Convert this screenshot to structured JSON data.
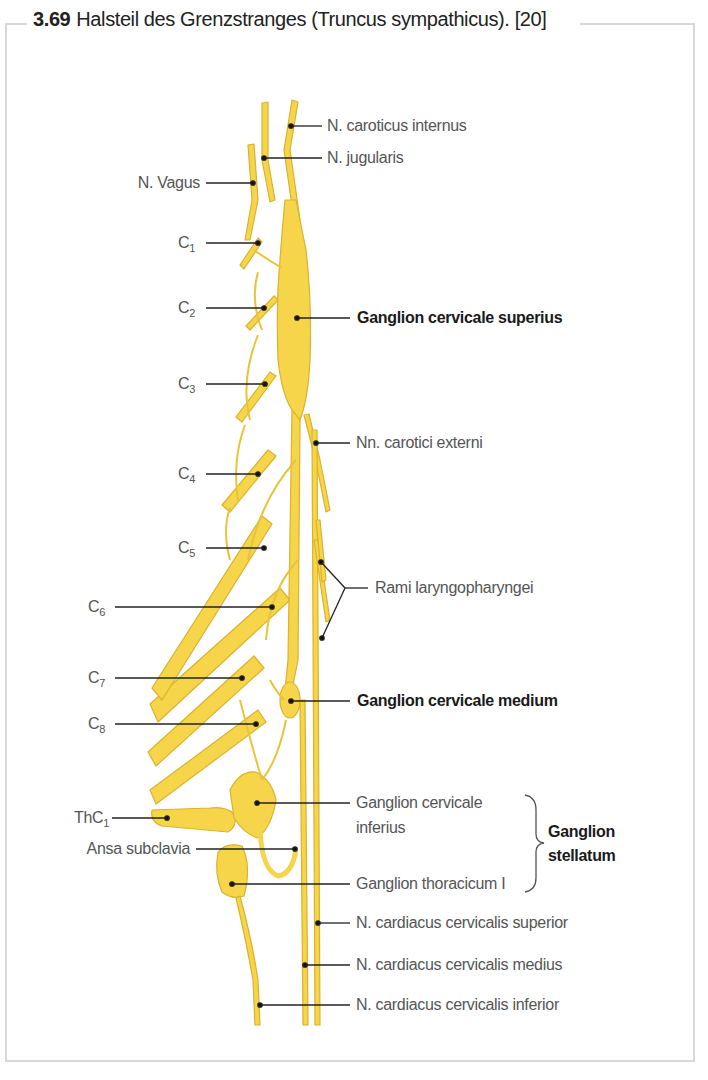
{
  "figure": {
    "number": "3.69",
    "title": "Halsteil des Grenzstranges (Truncus sympathicus). [20]"
  },
  "colors": {
    "nerve_fill": "#F6D54A",
    "nerve_stroke": "#D9B32E",
    "leader_line": "#222222",
    "label_text": "#555555",
    "label_bold": "#1a1a1a",
    "frame": "#d8d8d8"
  },
  "labels_left": {
    "n_vagus": "N. Vagus",
    "c1": {
      "base": "C",
      "sub": "1"
    },
    "c2": {
      "base": "C",
      "sub": "2"
    },
    "c3": {
      "base": "C",
      "sub": "3"
    },
    "c4": {
      "base": "C",
      "sub": "4"
    },
    "c5": {
      "base": "C",
      "sub": "5"
    },
    "c6": {
      "base": "C",
      "sub": "6"
    },
    "c7": {
      "base": "C",
      "sub": "7"
    },
    "c8": {
      "base": "C",
      "sub": "8"
    },
    "thc1": {
      "base": "ThC",
      "sub": "1"
    },
    "ansa_subclavia": "Ansa subclavia"
  },
  "labels_right": {
    "n_caroticus_internus": "N. caroticus internus",
    "n_jugularis": "N. jugularis",
    "ganglion_cervicale_superius": "Ganglion cervicale superius",
    "nn_carotici_externi": "Nn. carotici externi",
    "rami_laryngopharyngei": "Rami laryngopharyngei",
    "ganglion_cervicale_medium": "Ganglion cervicale medium",
    "ganglion_cervicale_inferius_line1": "Ganglion cervicale",
    "ganglion_cervicale_inferius_line2": "inferius",
    "ganglion_thoracicum": "Ganglion thoracicum I",
    "ganglion_stellatum_line1": "Ganglion",
    "ganglion_stellatum_line2": "stellatum",
    "n_cardiacus_superior": "N. cardiacus cervicalis superior",
    "n_cardiacus_medius": "N. cardiacus cervicalis medius",
    "n_cardiacus_inferior": "N. cardiacus cervicalis inferior"
  }
}
